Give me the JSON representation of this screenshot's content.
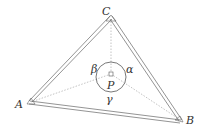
{
  "diagram": {
    "type": "triangle-with-interior-point",
    "vertices": {
      "A": {
        "label": "A",
        "x": 29,
        "y": 102
      },
      "B": {
        "label": "B",
        "x": 180,
        "y": 120
      },
      "C": {
        "label": "C",
        "x": 111,
        "y": 17
      }
    },
    "point": {
      "label": "P",
      "x": 111,
      "y": 74
    },
    "angles": {
      "alpha": "α",
      "beta": "β",
      "gamma": "γ"
    },
    "colors": {
      "line": "#555555",
      "dashed": "#999999",
      "text": "#333333"
    }
  }
}
